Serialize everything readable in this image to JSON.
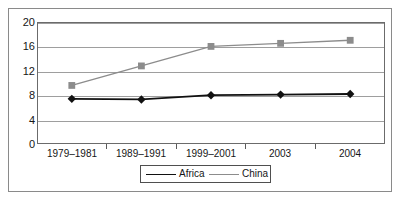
{
  "chart_data": {
    "type": "line",
    "title": "",
    "xlabel": "",
    "ylabel": "",
    "categories": [
      "1979–1981",
      "1989–1991",
      "1999–2001",
      "2003",
      "2004"
    ],
    "series": [
      {
        "name": "Africa",
        "values": [
          7.4,
          7.3,
          8.0,
          8.1,
          8.2
        ],
        "color": "#111111",
        "marker": "diamond"
      },
      {
        "name": "China",
        "values": [
          9.6,
          12.8,
          16.0,
          16.5,
          17.0
        ],
        "color": "#8c8c8c",
        "marker": "square"
      }
    ],
    "ylim": [
      0,
      20
    ],
    "yticks": [
      0,
      4,
      8,
      12,
      16,
      20
    ],
    "ytick_labels": [
      "0",
      "4",
      "8",
      "12",
      "16",
      "20"
    ],
    "grid": true,
    "legend_position": "bottom"
  },
  "legend": {
    "entries": [
      {
        "label": "Africa"
      },
      {
        "label": "China"
      }
    ]
  },
  "axes": {
    "y_labels": [
      "20",
      "16",
      "12",
      "8",
      "4",
      "0"
    ],
    "x_labels": [
      "1979–1981",
      "1989–1991",
      "1999–2001",
      "2003",
      "2004"
    ]
  },
  "colors": {
    "africa": "#111111",
    "china": "#8c8c8c",
    "gridline": "#9e9e9e",
    "frame": "#8a8a8a",
    "plot_border": "#6b6b6b",
    "text": "#161616",
    "background": "#ffffff"
  }
}
